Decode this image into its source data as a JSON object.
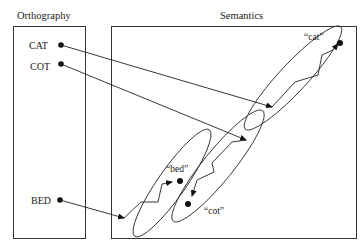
{
  "panels": {
    "orthography": {
      "label": "Orthography"
    },
    "semantics": {
      "label": "Semantics"
    }
  },
  "orthographic_words": [
    {
      "label": "CAT"
    },
    {
      "label": "COT"
    },
    {
      "label": "BED"
    }
  ],
  "semantic_attractors": [
    {
      "label": "“cat”"
    },
    {
      "label": "“bed”"
    },
    {
      "label": "“cot”"
    }
  ]
}
